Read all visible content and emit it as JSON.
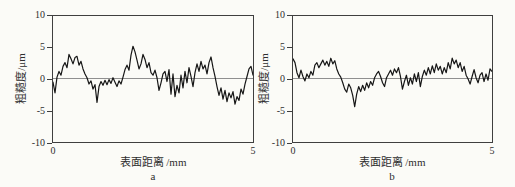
{
  "figure": {
    "background": "#fbfbf7",
    "trace_color": "#161616",
    "frame_color": "#3f3f3f",
    "zero_line_color": "#8f8f8f"
  },
  "chart_data": [
    {
      "type": "line",
      "panel_label": "a",
      "title": "",
      "xlabel": "表面距离 /mm",
      "ylabel": "粗糙度/μm",
      "xlim": [
        0,
        5
      ],
      "ylim": [
        -10,
        10
      ],
      "x_ticks": [
        "0",
        "5"
      ],
      "y_ticks": [
        "10",
        "5",
        "0",
        "-5",
        "-10"
      ],
      "grid": false,
      "legend": "none",
      "x_start": 0,
      "x_step": 0.05,
      "values": [
        -0.5,
        -2.2,
        0.3,
        1.2,
        0.6,
        2.0,
        2.6,
        1.8,
        3.9,
        3.2,
        2.4,
        3.4,
        3.6,
        2.2,
        2.8,
        1.6,
        0.8,
        0.2,
        -0.8,
        -0.3,
        -1.6,
        -0.9,
        -3.7,
        -1.2,
        -0.4,
        -1.0,
        -0.2,
        -0.9,
        -0.1,
        -0.7,
        0.2,
        -0.5,
        -1.2,
        -0.3,
        -0.8,
        0.3,
        1.5,
        2.2,
        1.4,
        3.8,
        5.2,
        4.3,
        3.0,
        1.6,
        2.4,
        3.9,
        3.1,
        1.8,
        2.6,
        1.0,
        0.6,
        1.4,
        0.2,
        -1.8,
        -0.6,
        0.8,
        1.2,
        -0.4,
        1.5,
        -2.4,
        0.8,
        -2.8,
        -1.0,
        -2.2,
        0.6,
        -1.4,
        1.2,
        -0.6,
        1.8,
        0.4,
        -1.2,
        1.0,
        2.4,
        1.2,
        2.8,
        1.6,
        2.2,
        0.8,
        2.6,
        3.5,
        1.8,
        0.4,
        -1.2,
        -2.6,
        -1.4,
        -3.2,
        -1.8,
        -3.6,
        -2.2,
        -3.0,
        -2.0,
        -4.0,
        -2.8,
        -3.4,
        -1.6,
        -2.4,
        -0.8,
        0.4,
        1.6,
        2.0,
        0.6
      ]
    },
    {
      "type": "line",
      "panel_label": "b",
      "title": "",
      "xlabel": "表面距离 /mm",
      "ylabel": "粗糙度/μm",
      "xlim": [
        0,
        5
      ],
      "ylim": [
        -10,
        10
      ],
      "x_ticks": [
        "0",
        "5"
      ],
      "y_ticks": [
        "10",
        "5",
        "0",
        "-5",
        "-10"
      ],
      "grid": false,
      "legend": "none",
      "x_start": 0,
      "x_step": 0.05,
      "values": [
        3.2,
        2.6,
        1.0,
        0.2,
        1.4,
        0.4,
        -0.3,
        0.8,
        0.2,
        1.2,
        0.6,
        2.2,
        2.6,
        1.8,
        2.4,
        3.0,
        2.2,
        2.8,
        2.0,
        3.3,
        2.4,
        2.9,
        1.6,
        0.8,
        0.3,
        -0.6,
        -1.6,
        -2.1,
        -0.8,
        -1.4,
        -2.6,
        -4.4,
        -2.4,
        -1.2,
        -2.0,
        -1.0,
        -1.8,
        -0.6,
        -1.4,
        -0.4,
        -1.0,
        0.2,
        0.8,
        1.2,
        0.4,
        -0.6,
        -1.2,
        0.2,
        0.8,
        1.4,
        0.6,
        1.6,
        1.0,
        1.8,
        0.4,
        -1.6,
        -0.4,
        0.6,
        -1.0,
        0.2,
        -0.8,
        0.8,
        -0.4,
        1.0,
        -1.2,
        0.4,
        1.4,
        0.6,
        1.8,
        0.8,
        2.1,
        1.0,
        2.4,
        1.4,
        2.0,
        0.8,
        1.8,
        1.0,
        2.6,
        1.6,
        3.3,
        2.4,
        3.0,
        1.8,
        2.6,
        1.2,
        2.0,
        0.6,
        0.0,
        -0.8,
        0.4,
        1.5,
        0.2,
        -0.6,
        0.6,
        1.0,
        -0.4,
        0.8,
        -0.2,
        1.6,
        1.2
      ]
    }
  ]
}
